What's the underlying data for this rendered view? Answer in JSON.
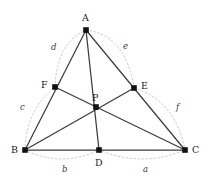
{
  "figure": {
    "kind": "triangle-with-cevians-and-arcs",
    "background_color": "#ffffff",
    "edge_color": "#3c3c3c",
    "cevian_color": "#3c3c3c",
    "arc_color": "#c8c8c8",
    "point_color": "#111111",
    "label_color": "#1a1a1a"
  },
  "vertices": [
    {
      "name": "A",
      "label": "A",
      "x": 86,
      "y": 30,
      "label_x": 82,
      "label_y": 13
    },
    {
      "name": "B",
      "label": "B",
      "x": 25,
      "y": 150,
      "label_x": 11,
      "label_y": 145
    },
    {
      "name": "C",
      "label": "C",
      "x": 185,
      "y": 150,
      "label_x": 192,
      "label_y": 145
    }
  ],
  "cevian_feet": [
    {
      "name": "D",
      "label": "D",
      "x": 99,
      "y": 150,
      "label_x": 95,
      "label_y": 158
    },
    {
      "name": "E",
      "label": "E",
      "x": 134,
      "y": 88,
      "label_x": 141,
      "label_y": 81
    },
    {
      "name": "F",
      "label": "F",
      "x": 55,
      "y": 87,
      "label_x": 41,
      "label_y": 80
    }
  ],
  "interior_point": {
    "name": "P",
    "label": "P",
    "x": 96,
    "y": 107,
    "label_x": 92,
    "label_y": 93
  },
  "segment_labels": [
    {
      "name": "label-a",
      "text": "a",
      "x": 143,
      "y": 165,
      "between": "D-C"
    },
    {
      "name": "label-b",
      "text": "b",
      "x": 62,
      "y": 165,
      "between": "B-D"
    },
    {
      "name": "label-c",
      "text": "c",
      "x": 20,
      "y": 103,
      "between": "B-F"
    },
    {
      "name": "label-d",
      "text": "d",
      "x": 51,
      "y": 43,
      "between": "F-A"
    },
    {
      "name": "label-e",
      "text": "e",
      "x": 123,
      "y": 42,
      "between": "A-E"
    },
    {
      "name": "label-f",
      "text": "f",
      "x": 176,
      "y": 103,
      "between": "E-C"
    }
  ],
  "triangle_edges": [
    {
      "name": "edge-AB",
      "from": "A",
      "to": "B"
    },
    {
      "name": "edge-BC",
      "from": "B",
      "to": "C"
    },
    {
      "name": "edge-CA",
      "from": "C",
      "to": "A"
    }
  ],
  "cevians": [
    {
      "name": "cevian-A-D",
      "from": "A",
      "to": "D"
    },
    {
      "name": "cevian-B-E",
      "from": "B",
      "to": "E"
    },
    {
      "name": "cevian-C-F",
      "from": "C",
      "to": "F"
    }
  ],
  "arcs": [
    {
      "name": "arc-b-B-D",
      "from": "B",
      "to": "D",
      "bulge": "outward-down"
    },
    {
      "name": "arc-a-D-C",
      "from": "D",
      "to": "C",
      "bulge": "outward-down"
    },
    {
      "name": "arc-c-B-F",
      "from": "B",
      "to": "F",
      "bulge": "outward-left"
    },
    {
      "name": "arc-d-F-A",
      "from": "F",
      "to": "A",
      "bulge": "outward-left"
    },
    {
      "name": "arc-e-A-E",
      "from": "A",
      "to": "E",
      "bulge": "outward-right"
    },
    {
      "name": "arc-f-E-C",
      "from": "E",
      "to": "C",
      "bulge": "outward-right"
    }
  ]
}
